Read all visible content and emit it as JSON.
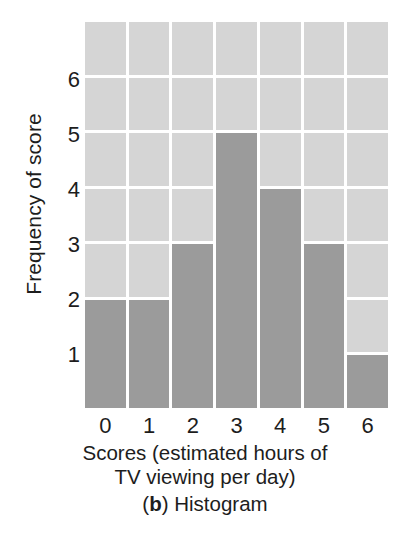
{
  "chart_data": {
    "type": "bar",
    "title": "",
    "caption_prefix": "(",
    "caption_label": "b",
    "caption_suffix": ") Histogram",
    "caption_full": "(b) Histogram",
    "xlabel_line1": "Scores (estimated hours of",
    "xlabel_line2": "TV viewing per day)",
    "xlabel": "Scores (estimated hours of TV viewing per day)",
    "ylabel": "Frequency of score",
    "categories": [
      "0",
      "1",
      "2",
      "3",
      "4",
      "5",
      "6"
    ],
    "values": [
      2,
      2,
      3,
      5,
      4,
      3,
      1
    ],
    "x_tick_labels": [
      "0",
      "1",
      "2",
      "3",
      "4",
      "5",
      "6"
    ],
    "y_tick_labels": [
      "1",
      "2",
      "3",
      "4",
      "5",
      "6"
    ],
    "y_tick_values": [
      1,
      2,
      3,
      4,
      5,
      6
    ],
    "ylim": [
      0,
      7
    ],
    "xlim_categories": 7,
    "grid_rows": 7,
    "grid": true,
    "legend": "none",
    "colors": {
      "bar": "#9b9b9b",
      "grid_cell": "#d5d5d5",
      "gridline": "#ffffff",
      "background": "#ffffff",
      "text": "#1d1d1d"
    }
  }
}
